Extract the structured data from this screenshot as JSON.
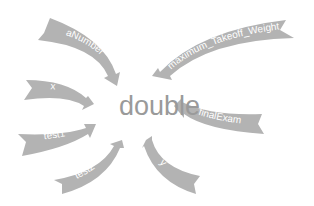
{
  "diagram": {
    "center_label": "double",
    "arrows": [
      {
        "label": "aNumber"
      },
      {
        "label": "maximum_Takeoff_Weight"
      },
      {
        "label": "x"
      },
      {
        "label": "finalExam"
      },
      {
        "label": "test1"
      },
      {
        "label": "test2"
      },
      {
        "label": "y"
      }
    ],
    "colors": {
      "ribbon": "#b3b3b3",
      "ribbon_text": "#ffffff",
      "center_text": "#9a9a9a"
    }
  }
}
